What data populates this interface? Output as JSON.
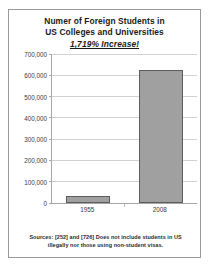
{
  "chart_data": {
    "type": "bar",
    "title": "Numer of Foreign Students in US Colleges and Universities",
    "title_lines": [
      "Numer of Foreign Students in",
      "US Colleges and Universities"
    ],
    "subtitle": "1,719% Increase!",
    "categories": [
      "1955",
      "2008"
    ],
    "values": [
      34000,
      623000
    ],
    "xlabel": "",
    "ylabel": "",
    "ylim": [
      0,
      700000
    ],
    "ytick_values": [
      0,
      100000,
      200000,
      300000,
      400000,
      500000,
      600000,
      700000
    ],
    "ytick_labels": [
      "0",
      "100,000",
      "200,000",
      "300,000",
      "400,000",
      "500,000",
      "600,000",
      "700,000"
    ],
    "grid": true,
    "legend": "none",
    "bar_color": "#a0a0a0",
    "bar_edge_color": "#5d5d5d",
    "gridline_color": "#d2d2d2",
    "axis_color": "#a6a6a6",
    "annotations": [
      "Sources: [252] and [726] Does not include students in US",
      "illegally nor those using non-student visas."
    ]
  },
  "footnote": {
    "line1": "Sources: [252] and [726] Does not include students in US",
    "line2": "illegally nor those using non-student visas."
  }
}
